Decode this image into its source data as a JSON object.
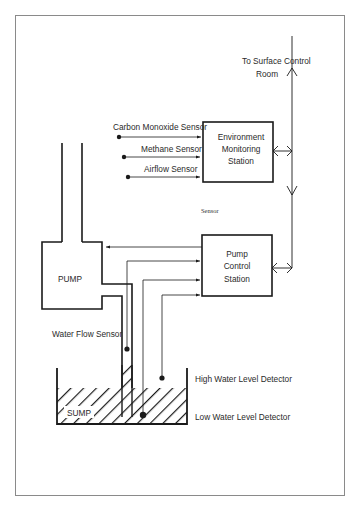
{
  "diagram": {
    "colors": {
      "line": "#1a1a1a",
      "frame": "#8a8a8a",
      "background": "#ffffff"
    },
    "surface_link": {
      "label_line1": "To Surface Control",
      "label_line2": "Room"
    },
    "environment_station": {
      "label_line1": "Environment",
      "label_line2": "Monitoring",
      "label_line3": "Station"
    },
    "pump_station": {
      "label_line1": "Pump",
      "label_line2": "Control",
      "label_line3": "Station"
    },
    "sensors": [
      {
        "label": "Carbon Monoxide Sensor"
      },
      {
        "label": "Methane Sensor"
      },
      {
        "label": "Airflow Sensor"
      }
    ],
    "stray_label": "Sensor",
    "pump": {
      "label": "PUMP"
    },
    "water_flow_sensor": {
      "label": "Water Flow Sensor"
    },
    "sump": {
      "label": "SUMP"
    },
    "high_water_detector": {
      "label": "High Water Level  Detector"
    },
    "low_water_detector": {
      "label": "Low Water Level Detector"
    }
  }
}
